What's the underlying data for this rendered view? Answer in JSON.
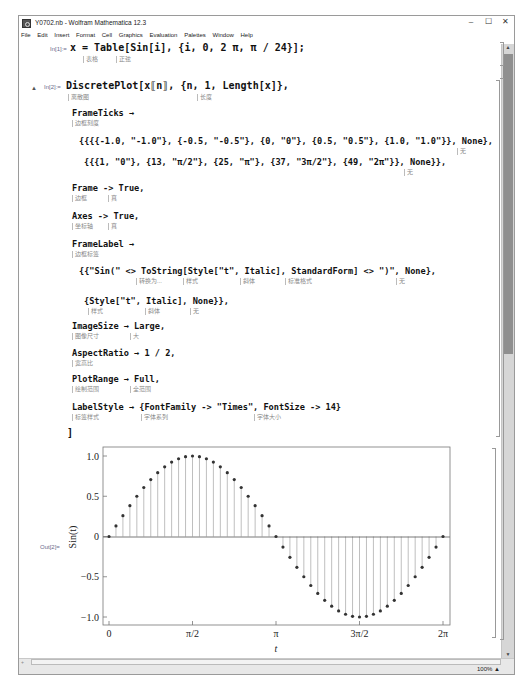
{
  "window": {
    "title": "Y0702.nb - Wolfram Mathematica 12.3",
    "controls": {
      "minimize": "–",
      "maximize": "☐",
      "close": "✕"
    }
  },
  "menu": [
    "File",
    "Edit",
    "Insert",
    "Format",
    "Cell",
    "Graphics",
    "Evaluation",
    "Palettes",
    "Window",
    "Help"
  ],
  "cells": {
    "in1": {
      "label": "In[1]:=",
      "code": "x = Table[Sin[i], {i, 0, 2 π, π / 24}];",
      "hints": [
        "表格",
        "正弦"
      ]
    },
    "in2": {
      "label": "In[2]:=",
      "line1": "DiscretePlot[x⟦n⟧, {n, 1, Length[x]},",
      "line1_hints": [
        "离散图",
        "长度"
      ],
      "frameticks_head": "FrameTicks →",
      "frameticks_hint": "边框刻度",
      "frameticks_y": "{{{{-1.0, \"-1.0\"}, {-0.5, \"-0.5\"}, {0, \"0\"}, {0.5, \"0.5\"}, {1.0, \"1.0\"}}, None},",
      "frameticks_y_hint": "无",
      "frameticks_x": "{{{1, \"0\"}, {13, \"π/2\"}, {25, \"π\"}, {37, \"3π/2\"}, {49, \"2π\"}}, None}},",
      "frameticks_x_hint": "无",
      "frame": "Frame -> True,",
      "frame_hints": [
        "边框",
        "真"
      ],
      "axes": "Axes -> True,",
      "axes_hints": [
        "坐标轴",
        "真"
      ],
      "framelabel_head": "FrameLabel →",
      "framelabel_hint": "边框标签",
      "framelabel_1": "{{\"Sin(\" <> ToString[Style[\"t\", Italic], StandardForm] <> \")\", None},",
      "framelabel_1_hints": [
        "转换为...",
        "样式",
        "斜体",
        "标准格式",
        "无"
      ],
      "framelabel_2": "{Style[\"t\", Italic], None}},",
      "framelabel_2_hints": [
        "样式",
        "斜体",
        "无"
      ],
      "imagesize": "ImageSize → Large,",
      "imagesize_hints": [
        "图像尺寸",
        "大"
      ],
      "aspectratio": "AspectRatio → 1 / 2,",
      "aspectratio_hint": "宽高比",
      "plotrange": "PlotRange → Full,",
      "plotrange_hints": [
        "绘制范围",
        "全范围"
      ],
      "labelstyle": "LabelStyle → {FontFamily -> \"Times\", FontSize -> 14}",
      "labelstyle_hints": [
        "标签样式",
        "字体系列",
        "字体大小"
      ],
      "close": "]"
    },
    "out2": {
      "label": "Out[2]="
    }
  },
  "status": {
    "zoom": "100%",
    "zoom_arrow": "▲"
  },
  "chart_data": {
    "type": "scatter",
    "subtype": "discrete stem plot",
    "title": "",
    "xlabel": "t",
    "ylabel": "Sin(t)",
    "x_ticks": [
      {
        "n": 1,
        "label": "0"
      },
      {
        "n": 13,
        "label": "π/2"
      },
      {
        "n": 25,
        "label": "π"
      },
      {
        "n": 37,
        "label": "3π/2"
      },
      {
        "n": 49,
        "label": "2π"
      }
    ],
    "y_ticks": [
      {
        "v": -1.0,
        "label": "−1.0"
      },
      {
        "v": -0.5,
        "label": "−0.5"
      },
      {
        "v": 0,
        "label": "0"
      },
      {
        "v": 0.5,
        "label": "0.5"
      },
      {
        "v": 1.0,
        "label": "1.0"
      }
    ],
    "xlim": [
      1,
      49
    ],
    "ylim": [
      -1.0,
      1.0
    ],
    "frame": true,
    "axes": true,
    "x": [
      1,
      2,
      3,
      4,
      5,
      6,
      7,
      8,
      9,
      10,
      11,
      12,
      13,
      14,
      15,
      16,
      17,
      18,
      19,
      20,
      21,
      22,
      23,
      24,
      25,
      26,
      27,
      28,
      29,
      30,
      31,
      32,
      33,
      34,
      35,
      36,
      37,
      38,
      39,
      40,
      41,
      42,
      43,
      44,
      45,
      46,
      47,
      48,
      49
    ],
    "values": [
      0,
      0.131,
      0.259,
      0.383,
      0.5,
      0.609,
      0.707,
      0.793,
      0.866,
      0.924,
      0.966,
      0.991,
      1.0,
      0.991,
      0.966,
      0.924,
      0.866,
      0.793,
      0.707,
      0.609,
      0.5,
      0.383,
      0.259,
      0.131,
      0,
      -0.131,
      -0.259,
      -0.383,
      -0.5,
      -0.609,
      -0.707,
      -0.793,
      -0.866,
      -0.924,
      -0.966,
      -0.991,
      -1.0,
      -0.991,
      -0.966,
      -0.924,
      -0.866,
      -0.793,
      -0.707,
      -0.609,
      -0.5,
      -0.383,
      -0.259,
      -0.131,
      0
    ],
    "colors": {
      "point": "#333333",
      "stem": "#b8b8b8",
      "frame": "#777777"
    }
  }
}
